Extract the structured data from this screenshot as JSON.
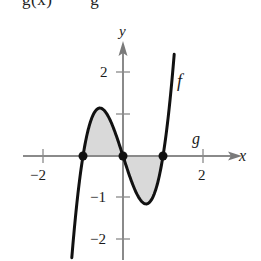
{
  "header_partial_text": "g(x)        g",
  "chart_data": {
    "type": "line",
    "title": "",
    "xlabel": "x",
    "ylabel": "y",
    "xlim": [
      -2.5,
      3.2
    ],
    "ylim": [
      -2.5,
      2.6
    ],
    "x_ticks": [
      -2,
      2
    ],
    "x_tick_labels": [
      "−2",
      "2"
    ],
    "y_ticks": [
      -2,
      -1,
      1,
      2
    ],
    "y_tick_labels": [
      "−2",
      "−1",
      "",
      "2"
    ],
    "grid": false,
    "series": [
      {
        "name": "f",
        "label": "f",
        "expression": "f(x) = 3x^3 - 3x",
        "x_range": [
          -1.28,
          1.28
        ],
        "color": "#111111",
        "points": [
          [
            -1.28,
            -2.45
          ],
          [
            -1.0,
            0
          ],
          [
            -0.577,
            1.155
          ],
          [
            0,
            0
          ],
          [
            0.577,
            -1.155
          ],
          [
            1.0,
            0
          ],
          [
            1.28,
            2.45
          ]
        ]
      },
      {
        "name": "g",
        "label": "g",
        "expression": "g(x) = 0",
        "color": "#111111"
      }
    ],
    "intersections": [
      [
        -1,
        0
      ],
      [
        0,
        0
      ],
      [
        1,
        0
      ]
    ],
    "shaded_regions": [
      {
        "from": -1,
        "to": 0,
        "between": [
          "f",
          "g"
        ],
        "color": "#d9d9d9"
      },
      {
        "from": 0,
        "to": 1,
        "between": [
          "f",
          "g"
        ],
        "color": "#d9d9d9"
      }
    ]
  },
  "labels": {
    "x_axis": "x",
    "y_axis": "y",
    "f": "f",
    "g": "g",
    "xm2": "−2",
    "x2": "2",
    "y2": "2",
    "ym1": "−1",
    "ym2": "−2"
  },
  "style": {
    "axis_color": "#8a8a8a",
    "curve_color": "#111111",
    "shade_color": "#d9d9d9",
    "point_color": "#111111"
  }
}
